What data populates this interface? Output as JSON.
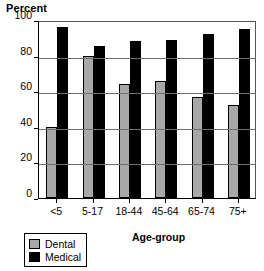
{
  "chart_data": {
    "type": "bar",
    "title": "",
    "ylabel": "Percent",
    "xlabel": "Age-group",
    "categories": [
      "<5",
      "5-17",
      "18-44",
      "45-64",
      "65-74",
      "75+"
    ],
    "series": [
      {
        "name": "Dental",
        "color": "#a8a8a8",
        "values": [
          40,
          80,
          64,
          66,
          57,
          52
        ]
      },
      {
        "name": "Medical",
        "color": "#000000",
        "values": [
          96,
          85.5,
          88,
          89,
          92,
          95
        ]
      }
    ],
    "ylim": [
      0,
      100
    ],
    "yticks": [
      "0",
      "20",
      "40",
      "60",
      "80",
      "100"
    ],
    "grid": true,
    "legend_position": "bottom-left"
  },
  "legend": {
    "items": [
      {
        "label": "Dental"
      },
      {
        "label": "Medical"
      }
    ]
  }
}
